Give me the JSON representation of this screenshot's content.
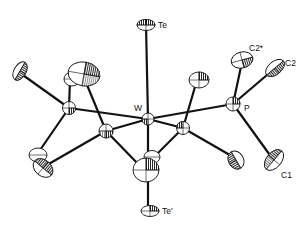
{
  "diagram": {
    "type": "ORTEP molecular structure",
    "labels": {
      "te_top": "Te",
      "te_bottom": "Te'",
      "w": "W",
      "p": "P",
      "c1": "C1",
      "c2": "C2",
      "c2_star": "C2*"
    },
    "colors": {
      "ink": "#111111",
      "background": "#ffffff"
    }
  }
}
